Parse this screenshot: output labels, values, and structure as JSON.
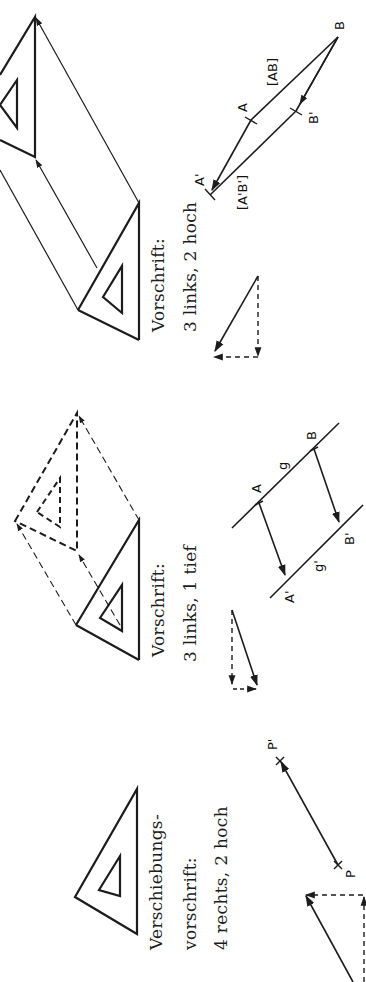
{
  "page": {
    "orientation": "rotated-90-ccw",
    "topic": "Verschiebung (translation) figures"
  },
  "panels": [
    {
      "id": "panel-1",
      "caption": {
        "line1": "Verschiebungs-",
        "line2": "vorschrift:",
        "line3": "4 rechts, 2 hoch"
      },
      "points": {
        "p": "P",
        "p_prime": "P'"
      }
    },
    {
      "id": "panel-2",
      "caption": {
        "line1": "Vorschrift:",
        "line2": "3 links, 1 tief"
      },
      "points": {
        "a": "A",
        "b": "B",
        "a_prime": "A'",
        "b_prime": "B'",
        "g": "g",
        "g_prime": "g'"
      }
    },
    {
      "id": "panel-3",
      "caption": {
        "line1": "Vorschrift:",
        "line2": "3 links, 2 hoch"
      },
      "points": {
        "a": "A",
        "b": "B",
        "a_prime": "A'",
        "b_prime": "B'",
        "seg_ab": "[AB]",
        "seg_ab_prime": "[A'B']"
      }
    }
  ],
  "colors": {
    "ink": "#1c1c1c",
    "background": "#ffffff"
  }
}
